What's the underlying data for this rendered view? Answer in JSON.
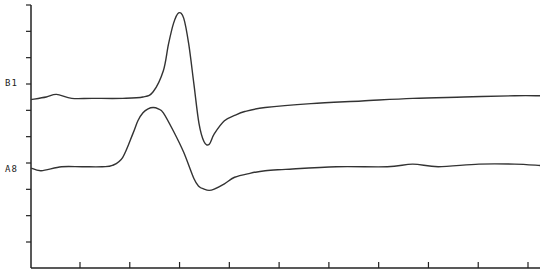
{
  "chart_data": {
    "type": "line",
    "title": "",
    "xlabel": "",
    "ylabel": "",
    "grid": false,
    "legend": "none",
    "series_labels": [
      "B1",
      "A8"
    ],
    "x_ticks_count": 10,
    "y_ticks_count": 10,
    "xlim": [
      0,
      100
    ],
    "ylim": [
      0,
      100
    ],
    "series": [
      {
        "name": "B1",
        "x": [
          0,
          3,
          5,
          8,
          12,
          18,
          22,
          24,
          26,
          27,
          28,
          29,
          30,
          31,
          32,
          33,
          34,
          35,
          36,
          38,
          40,
          42,
          46,
          55,
          65,
          75,
          85,
          95,
          100
        ],
        "y": [
          64,
          65,
          66,
          64.5,
          64.5,
          64.5,
          65,
          67,
          75,
          85,
          93,
          97,
          95,
          85,
          70,
          55,
          48,
          47,
          51,
          56,
          58,
          59.5,
          61,
          62.5,
          63.5,
          64.5,
          65,
          65.5,
          65.5
        ]
      },
      {
        "name": "A8",
        "x": [
          0,
          2,
          6,
          10,
          14,
          16,
          18,
          20,
          21,
          22,
          23,
          24,
          25,
          26,
          28,
          30,
          32,
          33,
          34,
          35,
          36,
          38,
          40,
          43,
          46,
          50,
          60,
          70,
          75,
          80,
          88,
          95,
          100
        ],
        "y": [
          38,
          37,
          38.5,
          38.5,
          38.5,
          39,
          42,
          51,
          56,
          59,
          60.5,
          61,
          60.5,
          59,
          52,
          44,
          34,
          31,
          30,
          29.5,
          30,
          32,
          34.5,
          36,
          37,
          37.5,
          38.5,
          38.5,
          39.5,
          38.5,
          39.5,
          39.5,
          39
        ]
      }
    ]
  },
  "labels": {
    "b1": "B1",
    "a8": "A8"
  }
}
